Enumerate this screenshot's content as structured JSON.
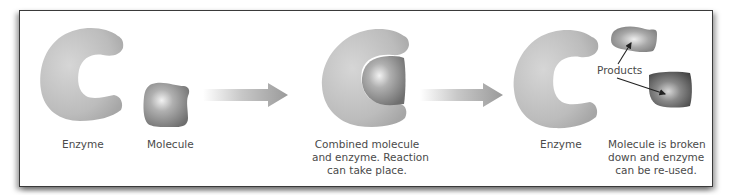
{
  "diagram": {
    "stages": [
      {
        "id": "enzyme",
        "label": "Enzyme"
      },
      {
        "id": "molecule",
        "label": "Molecule"
      },
      {
        "id": "combined",
        "label_lines": [
          "Combined molecule",
          "and enzyme. Reaction",
          "can take place."
        ]
      },
      {
        "id": "enzyme-reused",
        "label": "Enzyme"
      },
      {
        "id": "result",
        "label_lines": [
          "Molecule is broken",
          "down and enzyme",
          "can be re-used."
        ]
      }
    ],
    "products_label": "Products",
    "arrows": [
      "arrow-1",
      "arrow-2"
    ],
    "colors": {
      "enzyme": "#b8b8b8",
      "molecule": "#8f8f8f",
      "product_dark": "#555555",
      "arrow": "#a0a0a0",
      "border": "#3a3a3a",
      "text": "#4a4a4a"
    }
  }
}
